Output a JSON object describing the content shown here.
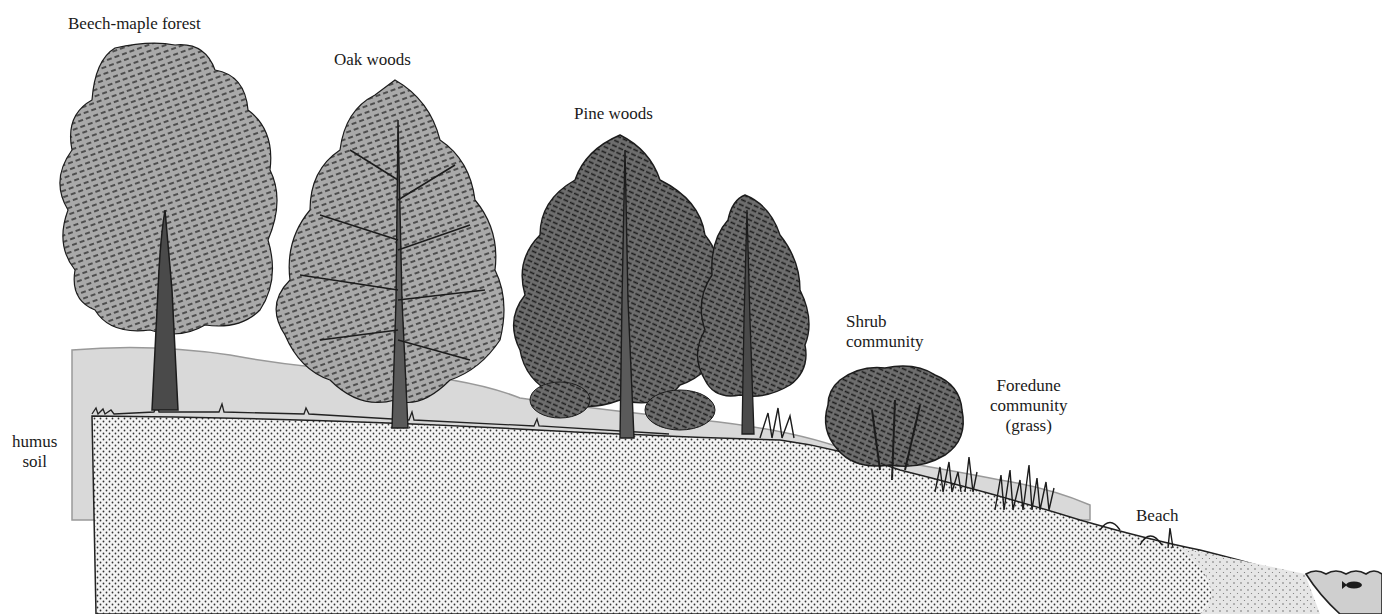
{
  "labels": {
    "beech_maple": "Beech-maple forest",
    "oak": "Oak woods",
    "pine": "Pine woods",
    "shrub": "Shrub\ncommunity",
    "foredune": "Foredune\ncommunity\n(grass)",
    "beach": "Beach",
    "humus": "humus\nsoil"
  },
  "colors": {
    "foliage_light": "#a9a9a9",
    "foliage_dark": "#6e6e6e",
    "ink": "#1c1c1c",
    "hill": "#d9d9d9",
    "sand": "#f2f2f2",
    "water": "#cfcfcf"
  }
}
